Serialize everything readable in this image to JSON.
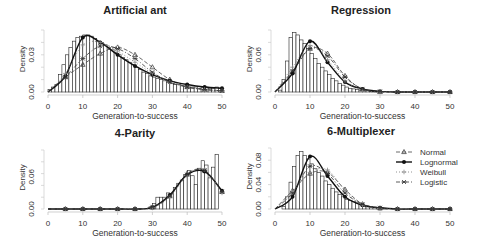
{
  "figure": {
    "legend": {
      "entries": [
        {
          "label": "Normal",
          "marker": "triangle",
          "line": "dashed"
        },
        {
          "label": "Lognormal",
          "marker": "circle",
          "line": "solid"
        },
        {
          "label": "Weibull",
          "marker": "plus",
          "line": "dotted"
        },
        {
          "label": "Logistic",
          "marker": "star",
          "line": "dashdot"
        }
      ],
      "position": "right of 6-Multiplexer panel"
    }
  },
  "chart_data": [
    {
      "type": "bar",
      "title": "Artificial ant",
      "xlabel": "Generation-to-success",
      "ylabel": "Density",
      "xlim": [
        0,
        50
      ],
      "ylim": [
        0,
        0.05
      ],
      "x_ticks": [
        "0",
        "10",
        "20",
        "30",
        "40",
        "50"
      ],
      "y_ticks": [
        "0.00",
        "0.03"
      ],
      "histogram": {
        "bin_width": 1,
        "bins_start": 1,
        "values": [
          0.002,
          0.004,
          0.006,
          0.014,
          0.022,
          0.03,
          0.036,
          0.041,
          0.044,
          0.045,
          0.046,
          0.046,
          0.045,
          0.043,
          0.041,
          0.04,
          0.038,
          0.036,
          0.034,
          0.032,
          0.03,
          0.028,
          0.026,
          0.024,
          0.022,
          0.02,
          0.018,
          0.016,
          0.015,
          0.013,
          0.012,
          0.011,
          0.01,
          0.009,
          0.008,
          0.007,
          0.006,
          0.006,
          0.005,
          0.005,
          0.004,
          0.004,
          0.004,
          0.003,
          0.004,
          0.004,
          0.003,
          0.003,
          0.004,
          0.003
        ]
      },
      "series": [
        {
          "name": "Normal",
          "x": [
            5,
            10,
            15,
            20,
            25,
            30,
            35,
            40,
            45,
            50
          ],
          "values": [
            0.012,
            0.022,
            0.031,
            0.036,
            0.03,
            0.02,
            0.01,
            0.004,
            0.002,
            0.001
          ]
        },
        {
          "name": "Lognormal",
          "x": [
            5,
            10,
            15,
            20,
            25,
            30,
            35,
            40,
            45,
            50
          ],
          "values": [
            0.013,
            0.044,
            0.04,
            0.03,
            0.021,
            0.014,
            0.009,
            0.006,
            0.004,
            0.003
          ]
        },
        {
          "name": "Weibull",
          "x": [
            5,
            10,
            15,
            20,
            25,
            30,
            35,
            40,
            45,
            50
          ],
          "values": [
            0.015,
            0.038,
            0.04,
            0.033,
            0.024,
            0.015,
            0.008,
            0.004,
            0.002,
            0.001
          ]
        },
        {
          "name": "Logistic",
          "x": [
            5,
            10,
            15,
            20,
            25,
            30,
            35,
            40,
            45,
            50
          ],
          "values": [
            0.012,
            0.027,
            0.037,
            0.035,
            0.027,
            0.016,
            0.008,
            0.004,
            0.002,
            0.001
          ]
        }
      ]
    },
    {
      "type": "bar",
      "title": "Regression",
      "xlabel": "Generation-to-success",
      "ylabel": "Density",
      "xlim": [
        0,
        50
      ],
      "ylim": [
        0,
        0.1
      ],
      "x_ticks": [
        "0",
        "10",
        "20",
        "30",
        "40",
        "50"
      ],
      "y_ticks": [
        "0.00",
        "0.06"
      ],
      "histogram": {
        "bin_width": 1,
        "bins_start": 2,
        "values": [
          0.003,
          0.02,
          0.05,
          0.088,
          0.096,
          0.092,
          0.084,
          0.078,
          0.07,
          0.062,
          0.054,
          0.046,
          0.04,
          0.034,
          0.028,
          0.022,
          0.018,
          0.014,
          0.011,
          0.008,
          0.006,
          0.005,
          0.004,
          0.003,
          0.002,
          0.002,
          0.001,
          0.001,
          0.001,
          0.001
        ]
      },
      "series": [
        {
          "name": "Normal",
          "x": [
            5,
            10,
            15,
            20,
            25,
            30,
            35,
            40,
            45,
            50
          ],
          "values": [
            0.032,
            0.07,
            0.062,
            0.026,
            0.004,
            0.0,
            0.0,
            0.0,
            0.0,
            0.0
          ]
        },
        {
          "name": "Lognormal",
          "x": [
            5,
            10,
            15,
            20,
            25,
            30,
            35,
            40,
            45,
            50
          ],
          "values": [
            0.03,
            0.082,
            0.048,
            0.016,
            0.005,
            0.001,
            0.0,
            0.0,
            0.0,
            0.0
          ]
        },
        {
          "name": "Weibull",
          "x": [
            5,
            10,
            15,
            20,
            25,
            30,
            35,
            40,
            45,
            50
          ],
          "values": [
            0.04,
            0.075,
            0.052,
            0.018,
            0.003,
            0.0,
            0.0,
            0.0,
            0.0,
            0.0
          ]
        },
        {
          "name": "Logistic",
          "x": [
            5,
            10,
            15,
            20,
            25,
            30,
            35,
            40,
            45,
            50
          ],
          "values": [
            0.034,
            0.07,
            0.058,
            0.024,
            0.005,
            0.001,
            0.0,
            0.0,
            0.0,
            0.0
          ]
        }
      ]
    },
    {
      "type": "bar",
      "title": "4-Parity",
      "xlabel": "Generation-to-success",
      "ylabel": "Density",
      "xlim": [
        0,
        50
      ],
      "ylim": [
        0,
        0.1
      ],
      "x_ticks": [
        "0",
        "10",
        "20",
        "30",
        "40",
        "50"
      ],
      "y_ticks": [
        "0.00",
        "0.06"
      ],
      "histogram": {
        "bin_width": 1,
        "bins_start": 30,
        "values": [
          0.004,
          0.01,
          0.022,
          0.022,
          0.022,
          0.03,
          0.028,
          0.04,
          0.048,
          0.054,
          0.064,
          0.072,
          0.062,
          0.046,
          0.076,
          0.09,
          0.082,
          0.058,
          0.078,
          0.102
        ]
      },
      "series": [
        {
          "name": "Normal",
          "x": [
            5,
            10,
            15,
            20,
            25,
            30,
            35,
            40,
            45,
            50
          ],
          "values": [
            0.0,
            0.0,
            0.0,
            0.0,
            0.0,
            0.003,
            0.024,
            0.066,
            0.072,
            0.032
          ]
        },
        {
          "name": "Lognormal",
          "x": [
            5,
            10,
            15,
            20,
            25,
            30,
            35,
            40,
            45,
            50
          ],
          "values": [
            0.0,
            0.0,
            0.0,
            0.0,
            0.0,
            0.003,
            0.026,
            0.064,
            0.07,
            0.034
          ]
        },
        {
          "name": "Weibull",
          "x": [
            5,
            10,
            15,
            20,
            25,
            30,
            35,
            40,
            45,
            50
          ],
          "values": [
            0.0,
            0.0,
            0.0,
            0.0,
            0.0,
            0.002,
            0.022,
            0.062,
            0.074,
            0.03
          ]
        },
        {
          "name": "Logistic",
          "x": [
            5,
            10,
            15,
            20,
            25,
            30,
            35,
            40,
            45,
            50
          ],
          "values": [
            0.0,
            0.0,
            0.0,
            0.0,
            0.0,
            0.004,
            0.024,
            0.064,
            0.072,
            0.032
          ]
        }
      ]
    },
    {
      "type": "bar",
      "title": "6-Multiplexer",
      "xlabel": "Generation-to-success",
      "ylabel": "Density",
      "xlim": [
        0,
        50
      ],
      "ylim": [
        0,
        0.1
      ],
      "x_ticks": [
        "0",
        "10",
        "20",
        "30",
        "40",
        "50"
      ],
      "y_ticks": [
        "0.00",
        "0.04",
        "0.08"
      ],
      "histogram": {
        "bin_width": 1,
        "bins_start": 3,
        "values": [
          0.004,
          0.02,
          0.044,
          0.07,
          0.088,
          0.094,
          0.088,
          0.082,
          0.074,
          0.066,
          0.06,
          0.054,
          0.046,
          0.04,
          0.034,
          0.028,
          0.024,
          0.02,
          0.016,
          0.014,
          0.012,
          0.01,
          0.008,
          0.006,
          0.005,
          0.004,
          0.003,
          0.002,
          0.002,
          0.001
        ]
      },
      "series": [
        {
          "name": "Normal",
          "x": [
            5,
            10,
            15,
            20,
            25,
            30,
            35,
            40,
            45,
            50
          ],
          "values": [
            0.03,
            0.058,
            0.06,
            0.032,
            0.008,
            0.001,
            0.0,
            0.0,
            0.0,
            0.0
          ]
        },
        {
          "name": "Lognormal",
          "x": [
            5,
            10,
            15,
            20,
            25,
            30,
            35,
            40,
            45,
            50
          ],
          "values": [
            0.02,
            0.086,
            0.054,
            0.02,
            0.006,
            0.002,
            0.0,
            0.0,
            0.0,
            0.0
          ]
        },
        {
          "name": "Weibull",
          "x": [
            5,
            10,
            15,
            20,
            25,
            30,
            35,
            40,
            45,
            50
          ],
          "values": [
            0.028,
            0.06,
            0.064,
            0.03,
            0.006,
            0.001,
            0.0,
            0.0,
            0.0,
            0.0
          ]
        },
        {
          "name": "Logistic",
          "x": [
            5,
            10,
            15,
            20,
            25,
            30,
            35,
            40,
            45,
            50
          ],
          "values": [
            0.026,
            0.07,
            0.058,
            0.026,
            0.008,
            0.002,
            0.0,
            0.0,
            0.0,
            0.0
          ]
        }
      ]
    }
  ]
}
